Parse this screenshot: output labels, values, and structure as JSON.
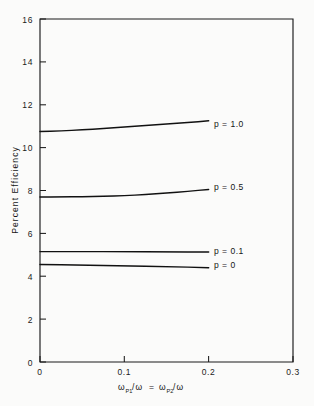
{
  "chart_data": {
    "type": "line",
    "title": "",
    "xlabel": "ωp1/ω = ωp2/ω",
    "ylabel": "Percent Efficiency",
    "xlim": [
      0,
      0.3
    ],
    "ylim": [
      0,
      16
    ],
    "xticks": [
      "0",
      "0.1",
      "0.2",
      "0.3"
    ],
    "xtick_values": [
      0,
      0.1,
      0.2,
      0.3
    ],
    "yticks": [
      "0",
      "2",
      "4",
      "6",
      "8",
      "10",
      "12",
      "14",
      "16"
    ],
    "ytick_values": [
      0,
      2,
      4,
      6,
      8,
      10,
      12,
      14,
      16
    ],
    "grid": false,
    "legend_position": "inline-right-of-curve-ends",
    "series": [
      {
        "name": "p = 1.0",
        "label": "p = 1.0",
        "x": [
          0.0,
          0.025,
          0.05,
          0.075,
          0.1,
          0.125,
          0.15,
          0.175,
          0.2
        ],
        "values": [
          10.75,
          10.78,
          10.83,
          10.89,
          10.96,
          11.03,
          11.1,
          11.17,
          11.25
        ]
      },
      {
        "name": "p = 0.5",
        "label": "p = 0.5",
        "x": [
          0.0,
          0.025,
          0.05,
          0.075,
          0.1,
          0.125,
          0.15,
          0.175,
          0.2
        ],
        "values": [
          7.7,
          7.7,
          7.71,
          7.73,
          7.76,
          7.81,
          7.88,
          7.96,
          8.05
        ]
      },
      {
        "name": "p = 0.1",
        "label": "p = 0.1",
        "x": [
          0.0,
          0.05,
          0.1,
          0.15,
          0.2
        ],
        "values": [
          5.15,
          5.15,
          5.15,
          5.14,
          5.13
        ]
      },
      {
        "name": "p = 0",
        "label": "p = 0",
        "x": [
          0.0,
          0.05,
          0.1,
          0.15,
          0.2
        ],
        "values": [
          4.55,
          4.52,
          4.49,
          4.45,
          4.4
        ]
      }
    ]
  },
  "axes": {
    "x_title_parts": {
      "omega1": "ω",
      "sub1": "P1",
      "slash1": "/ω",
      "equals": "=",
      "omega2": "ω",
      "sub2": "P2",
      "slash2": "/ω"
    },
    "y_title": "Percent Efficiency"
  },
  "labels": {
    "p_1_0": "p = 1.0",
    "p_0_5": "p = 0.5",
    "p_0_1": "p = 0.1",
    "p_0": "p = 0"
  },
  "xticks": {
    "t0": "0",
    "t1": "0.1",
    "t2": "0.2",
    "t3": "0.3"
  },
  "yticks": {
    "t0": "0",
    "t2": "2",
    "t4": "4",
    "t6": "6",
    "t8": "8",
    "t10": "10",
    "t12": "12",
    "t14": "14",
    "t16": "16"
  },
  "colors": {
    "background": "#fbfbfa",
    "ink": "#1a1a1a",
    "curve": "#111111"
  }
}
